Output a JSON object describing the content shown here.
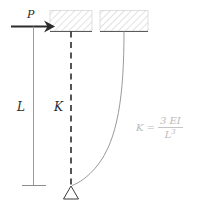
{
  "figure": {
    "labels": {
      "load": "P",
      "length": "L",
      "stiffness": "K"
    },
    "formula": {
      "lhs": "K",
      "equals": "=",
      "numerator": "3 EI",
      "denominator_base": "L",
      "denominator_exponent": "3"
    },
    "colors": {
      "ink": "#2b2b2b",
      "line": "#8c8c8c",
      "hatch": "#d2d2d2",
      "faint": "#b9b9b9"
    },
    "elements": {
      "arrow": "load-arrow",
      "left_column": "left-vertical-member",
      "left_base": "left-base-support",
      "dashed_spring": "dashed-spring-line",
      "pin_support": "triangle-pin-support",
      "deflected_beam": "deflected-column-curve",
      "hatch_block_left": "fixed-support-hatch-left",
      "hatch_block_right": "fixed-support-hatch-right"
    }
  }
}
